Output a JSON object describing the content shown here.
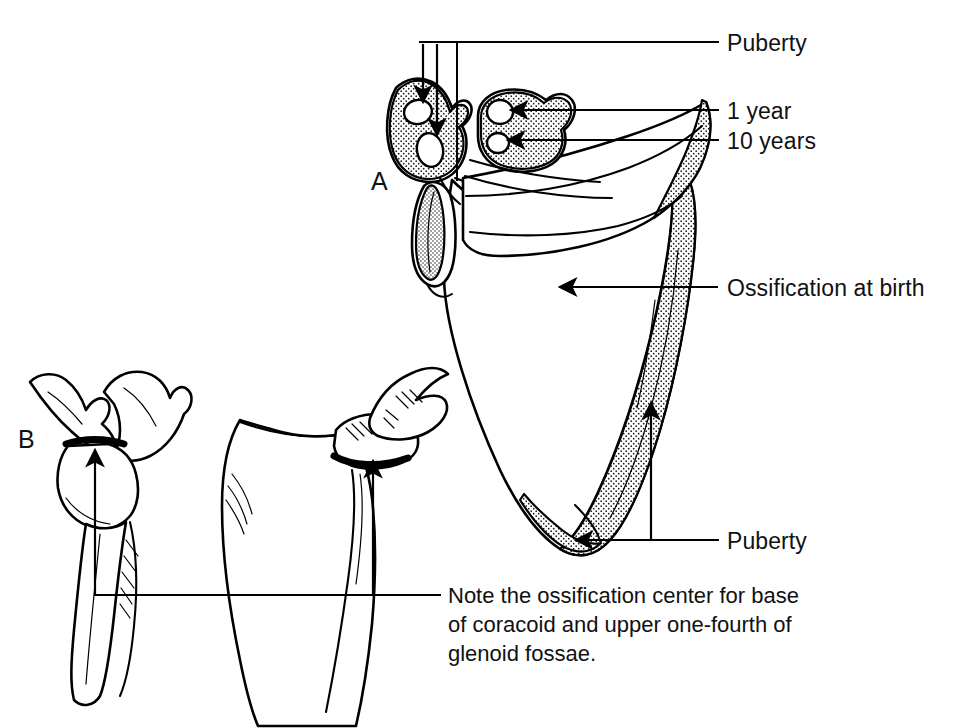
{
  "figure": {
    "background_color": "#ffffff",
    "ink_color": "#000000",
    "width": 970,
    "height": 728
  },
  "panel_letters": [
    {
      "name": "panel-a",
      "label": "A",
      "x": 371,
      "y": 190
    },
    {
      "name": "panel-b",
      "label": "B",
      "x": 18,
      "y": 448
    }
  ],
  "labels": {
    "puberty_top": {
      "text": "Puberty",
      "x": 727,
      "y": 56,
      "leader_y": 42,
      "leader_x_start": 420,
      "leader_x_end": 718
    },
    "one_year": {
      "text": "1 year",
      "x": 727,
      "y": 117,
      "leader_y": 110,
      "leader_x_start": 530,
      "leader_x_end": 718
    },
    "ten_years": {
      "text": "10 years",
      "x": 727,
      "y": 147,
      "leader_y": 140,
      "leader_x_start": 530,
      "leader_x_end": 718
    },
    "ossification_at_birth": {
      "text": "Ossification at birth",
      "x": 727,
      "y": 295,
      "leader_y": 287,
      "arrow_tip_x": 557,
      "leader_x_end": 718
    },
    "puberty_bottom": {
      "text": "Puberty",
      "x": 727,
      "y": 548,
      "leader_y": 540,
      "leader_x_start": 548,
      "leader_x_end": 718,
      "riser_x": 651,
      "riser_y_top": 435
    }
  },
  "note": {
    "name": "ossification-note",
    "lines": [
      "Note the ossification center for base",
      "of coracoid and upper one-fourth of",
      "glenoid fossae."
    ],
    "x": 448,
    "y_first": 603,
    "line_height": 29,
    "leader_y": 595,
    "leader_x_start": 95,
    "leader_x_end": 440,
    "riser_left_x": 95,
    "riser_right_x": 373
  },
  "arrows": {
    "coracoid_down_1": {
      "name": "coracoid-arrow-upper",
      "x": 423,
      "y_top": 44,
      "y_tip": 105
    },
    "coracoid_down_2": {
      "name": "coracoid-arrow-lower",
      "x": 437,
      "y_top": 44,
      "y_tip": 138
    },
    "glenoid_drop": {
      "name": "glenoid-base-line",
      "x": 457,
      "y_top": 44,
      "y_tip": 178
    },
    "acromion_1": {
      "name": "acromion-arrow-upper",
      "y": 110,
      "x_from": 545,
      "x_tip": 508
    },
    "acromion_2": {
      "name": "acromion-arrow-lower",
      "y": 140,
      "x_from": 545,
      "x_tip": 505
    },
    "birth_arrow": {
      "name": "ossification-birth-arrow",
      "y": 287,
      "x_from": 718,
      "x_tip": 557
    },
    "medial_border": {
      "name": "medial-border-arrow",
      "x": 651,
      "y_from": 435,
      "y_tip": 400
    },
    "inferior_angle": {
      "name": "inferior-angle-arrow",
      "y": 540,
      "x_from": 651,
      "x_tip": 573
    },
    "panel_b_arrow": {
      "name": "panel-b-glenoid-arrow",
      "x": 95,
      "y_from": 595,
      "y_tip": 447
    },
    "panel_mid_arrow": {
      "name": "panel-mid-glenoid-arrow",
      "x": 373,
      "y_from": 595,
      "y_tip": 458
    }
  },
  "views": [
    {
      "name": "scapula-anterior-view",
      "letter": "A",
      "description": "Large scapula, anterior aspect, stippled ossification zones"
    },
    {
      "name": "scapula-lateral-view",
      "letter": "B",
      "description": "Lateral view showing glenoid and coracoid"
    },
    {
      "name": "scapula-posterior-view",
      "letter": "",
      "description": "Oblique view showing glenoid fossa band"
    }
  ]
}
